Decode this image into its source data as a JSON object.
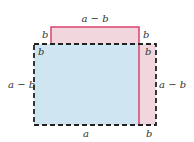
{
  "diagram": {
    "colors": {
      "blue_fill": "#cfe6f2",
      "pink_fill": "#f1d6de",
      "pink_line": "#d9436b",
      "dash_line": "#222222"
    },
    "labels": {
      "top": "a − b",
      "top_left_b": "b",
      "top_right_b": "b",
      "inner_left_b": "b",
      "inner_right_b": "b",
      "left_side": "a − b",
      "right_side": "a − b",
      "bottom": "a",
      "bottom_right_b": "b"
    }
  }
}
